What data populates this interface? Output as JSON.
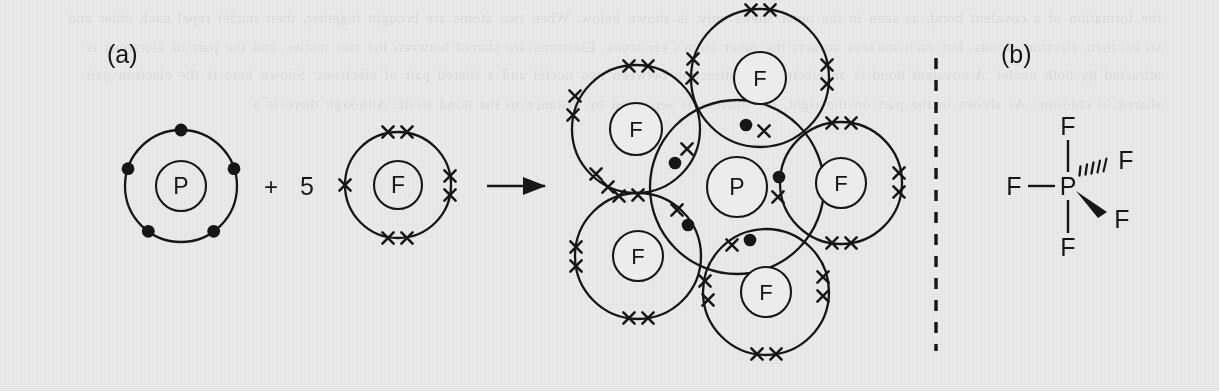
{
  "figure": {
    "background_color": "#ececed",
    "ink_color": "#161616",
    "width": 1219,
    "height": 391,
    "bleed_through_text": "the formation of a covalent bond, as seen in the outer shells only, is shown below. When two atoms are brought together, their nuclei repel each other and so do their electron clouds, but each nucleus attracts the other atom's electrons. Electrons are shared between the two nuclei, and the pair of electrons is attracted by both nuclei. A covalent bond is an electrostatic attraction between two nuclei and a shared pair of electrons. Shown here is the electron pair shared in chlorine. As shown in the part on the right, the nucleus is separated by distance in the bond itself. Although there is a",
    "panels": [
      {
        "id": "a",
        "label": "(a)"
      },
      {
        "id": "b",
        "label": "(b)"
      }
    ],
    "divider": {
      "type": "dashed-vertical-line",
      "x": 936,
      "y_top": 58,
      "y_bottom": 351
    }
  },
  "equation": {
    "plus_sign": "+",
    "coefficient": "5",
    "arrow": "reaction-arrow",
    "reactants": [
      {
        "symbol": "P",
        "name": "phosphorus-atom",
        "cx": 181,
        "cy": 186,
        "r_outer": 56,
        "r_inner": 25,
        "electron_glyph": "dot",
        "electron_count": 5,
        "electron_angles_deg": [
          90,
          162,
          234,
          306,
          18
        ]
      },
      {
        "symbol": "F",
        "name": "fluorine-atom",
        "cx": 398,
        "cy": 185,
        "r_outer": 53,
        "r_inner": 24,
        "electron_glyph": "cross",
        "electron_count": 7,
        "pairs": [
          {
            "angle_deg": 90,
            "count": 2
          },
          {
            "angle_deg": 270,
            "count": 2
          },
          {
            "angle_deg": 0,
            "count": 2
          },
          {
            "angle_deg": 180,
            "count": 1
          }
        ]
      }
    ],
    "product": {
      "name": "phosphorus-pentafluoride-molecule",
      "formula_center": {
        "symbol": "P",
        "cx": 737,
        "cy": 187,
        "r_outer": 87,
        "r_inner": 30
      },
      "fluorines": [
        {
          "symbol": "F",
          "position": "top",
          "cx": 760,
          "cy": 78,
          "r_outer": 69,
          "r_inner": 26
        },
        {
          "symbol": "F",
          "position": "right",
          "cx": 841,
          "cy": 183,
          "r_outer": 61,
          "r_inner": 25
        },
        {
          "symbol": "F",
          "position": "bottom",
          "cx": 766,
          "cy": 292,
          "r_outer": 63,
          "r_inner": 25
        },
        {
          "symbol": "F",
          "position": "lower-left",
          "cx": 638,
          "cy": 256,
          "r_outer": 63,
          "r_inner": 25
        },
        {
          "symbol": "F",
          "position": "upper-left",
          "cx": 636,
          "cy": 129,
          "r_outer": 64,
          "r_inner": 26
        }
      ],
      "bonding_pairs": 5,
      "bonding_pair_glyphs": [
        "dot",
        "cross"
      ],
      "lone_pairs_per_fluorine": 3
    }
  },
  "structural_formula": {
    "name": "pf5-structural-formula",
    "central_atom": {
      "symbol": "P",
      "x": 1068,
      "y": 186
    },
    "substituents": [
      {
        "symbol": "F",
        "x": 1068,
        "y": 126,
        "bond": "plain",
        "direction": "up"
      },
      {
        "symbol": "F",
        "x": 1068,
        "y": 247,
        "bond": "plain",
        "direction": "down"
      },
      {
        "symbol": "F",
        "x": 1014,
        "y": 186,
        "bond": "plain",
        "direction": "left"
      },
      {
        "symbol": "F",
        "x": 1126,
        "y": 160,
        "bond": "hashed",
        "direction": "upper-right"
      },
      {
        "symbol": "F",
        "x": 1122,
        "y": 219,
        "bond": "wedge",
        "direction": "lower-right"
      }
    ]
  }
}
